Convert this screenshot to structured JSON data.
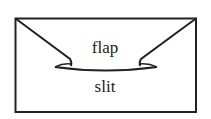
{
  "diagram": {
    "type": "envelope-flap-illustration",
    "labels": {
      "flap": "flap",
      "slit": "slit"
    },
    "colors": {
      "stroke": "#222222",
      "background": "#ffffff"
    }
  }
}
